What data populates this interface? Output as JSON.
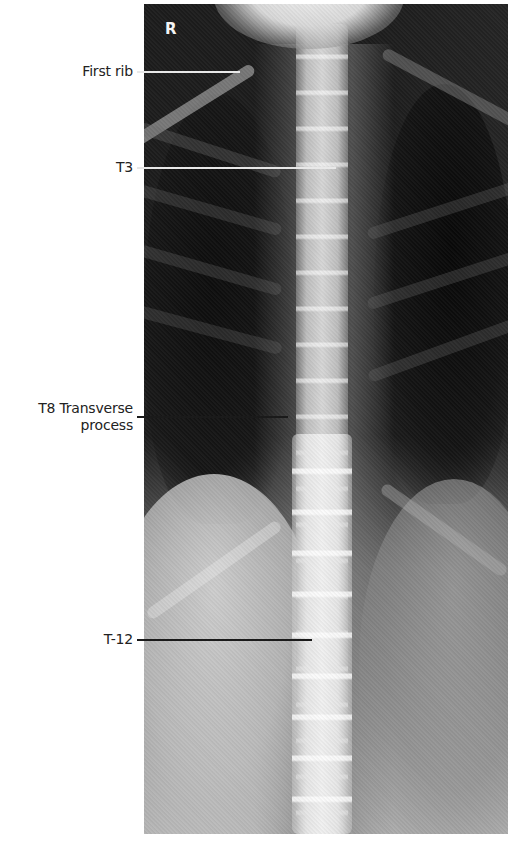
{
  "figure": {
    "type": "Labeled AP thoracic spine radiograph",
    "side_marker": "R",
    "colors": {
      "background": "#ffffff",
      "label_text": "#222222",
      "leader_on_dark": "#e8e8e8",
      "leader_on_light": "#1a1a1a"
    },
    "labels": [
      {
        "id": "first-rib",
        "lines": [
          "First rib"
        ],
        "text_top": 63,
        "line_y": 72,
        "line_x_end": 240,
        "line_color": "#e8e8e8"
      },
      {
        "id": "t3",
        "lines": [
          "T3"
        ],
        "text_top": 159,
        "line_y": 168,
        "line_x_end": 336,
        "line_color": "#e8e8e8"
      },
      {
        "id": "t8-transverse-process",
        "lines": [
          "T8 Transverse",
          "process"
        ],
        "text_top": 400,
        "line_y": 417,
        "line_x_end": 288,
        "line_color": "#1a1a1a"
      },
      {
        "id": "t12",
        "lines": [
          "T-12"
        ],
        "text_top": 631,
        "line_y": 640,
        "line_x_end": 312,
        "line_color": "#1a1a1a"
      }
    ]
  }
}
